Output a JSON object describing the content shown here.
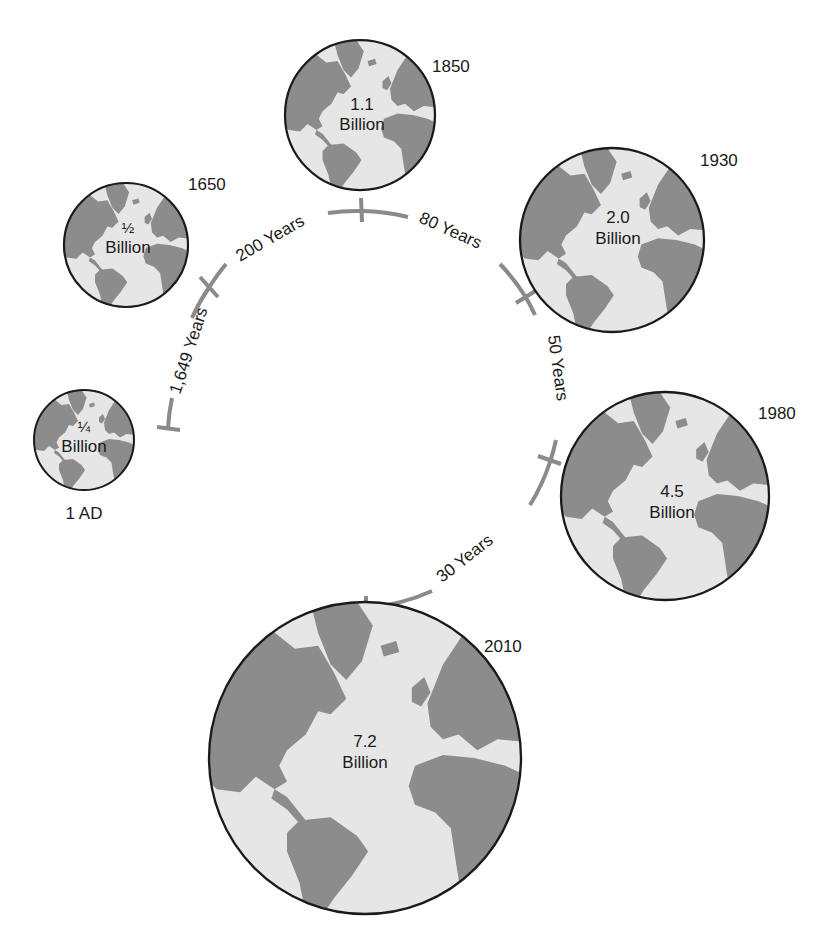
{
  "diagram": {
    "colors": {
      "land": "#8c8c8c",
      "ocean": "#e6e6e6",
      "outline": "#1a1a1a",
      "timeline": "#8a8a8a",
      "text": "#1a1a1a"
    },
    "globes": [
      {
        "year": "1 AD",
        "amount": "¼",
        "unit": "Billion"
      },
      {
        "year": "1650",
        "amount": "½",
        "unit": "Billion"
      },
      {
        "year": "1850",
        "amount": "1.1",
        "unit": "Billion"
      },
      {
        "year": "1930",
        "amount": "2.0",
        "unit": "Billion"
      },
      {
        "year": "1980",
        "amount": "4.5",
        "unit": "Billion"
      },
      {
        "year": "2010",
        "amount": "7.2",
        "unit": "Billion"
      }
    ],
    "intervals": [
      {
        "label": "1,649 Years"
      },
      {
        "label": "200 Years"
      },
      {
        "label": "80 Years"
      },
      {
        "label": "50 Years"
      },
      {
        "label": "30 Years"
      }
    ]
  }
}
